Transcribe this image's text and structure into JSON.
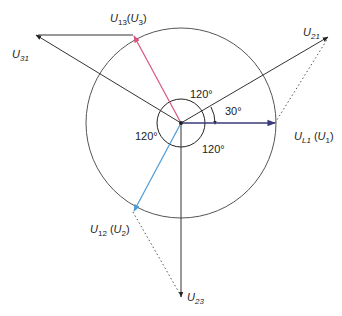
{
  "diagram": {
    "type": "phasor-diagram",
    "colors": {
      "line": "#333333",
      "u1": "#3a3a7a",
      "u3": "#d9557a",
      "u2": "#4a9ad8",
      "circle": "#555555"
    },
    "phasors": [
      {
        "id": "U1",
        "label_main": "U",
        "label_sub": "L1",
        "label_paren_main": "U",
        "label_paren_sub": "1",
        "angle_deg": 0,
        "magnitude": 1
      },
      {
        "id": "U3",
        "label_main": "U",
        "label_sub": "13",
        "label_paren_main": "U",
        "label_paren_sub": "3",
        "angle_deg": 120,
        "magnitude": 1
      },
      {
        "id": "U2",
        "label_main": "U",
        "label_sub": "12",
        "label_paren_main": "U",
        "label_paren_sub": "2",
        "angle_deg": 240,
        "magnitude": 1
      },
      {
        "id": "U21",
        "label_main": "U",
        "label_sub": "21",
        "angle_deg": 30,
        "magnitude": 1.732
      },
      {
        "id": "U31",
        "label_main": "U",
        "label_sub": "31",
        "angle_deg": 150,
        "magnitude": 1.732
      },
      {
        "id": "U23",
        "label_main": "U",
        "label_sub": "23",
        "angle_deg": 270,
        "magnitude": 1.732
      }
    ],
    "angle_labels": [
      "120°",
      "120°",
      "120°",
      "30°"
    ]
  }
}
